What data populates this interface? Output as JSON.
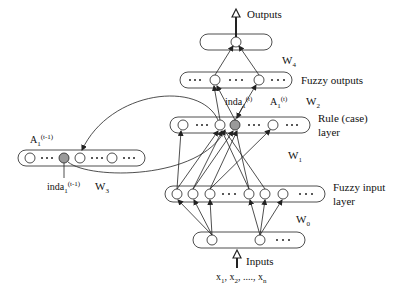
{
  "diagram": {
    "type": "neural-fuzzy network architecture",
    "colors": {
      "stroke": "#222222",
      "shaded_node": "#9a9a9a",
      "background": "#ffffff"
    },
    "layers": [
      {
        "id": "output",
        "label": "",
        "nodes": 1,
        "has_ellipsis": false
      },
      {
        "id": "fuzzy_outputs",
        "label": "Fuzzy outputs",
        "nodes": 2,
        "has_ellipsis": true
      },
      {
        "id": "rule",
        "label_line1": "Rule (case)",
        "label_line2": "layer",
        "nodes": 4,
        "shaded_node_index": 2,
        "has_ellipsis": true
      },
      {
        "id": "context",
        "label": "",
        "nodes": 4,
        "shaded_node_index": 1,
        "has_ellipsis": true
      },
      {
        "id": "fuzzy_input",
        "label_line1": "Fuzzy input",
        "label_line2": "layer",
        "nodes": 6,
        "has_ellipsis": true
      },
      {
        "id": "input",
        "label": "",
        "nodes": 2,
        "has_ellipsis": true
      }
    ],
    "labels": {
      "outputs": "Outputs",
      "inputs": "Inputs",
      "input_vars": {
        "x1": "x",
        "x1_sub": "1",
        "x2": "x",
        "x2_sub": "2",
        "dots": "....",
        "xn": "x",
        "xn_sub": "n"
      },
      "fuzzy_outputs": "Fuzzy outputs",
      "rule_line1": "Rule (case)",
      "rule_line2": "layer",
      "fuzzy_input_line1": "Fuzzy input",
      "fuzzy_input_line2": "layer",
      "w4": {
        "base": "W",
        "sub": "4"
      },
      "w2": {
        "base": "W",
        "sub": "2"
      },
      "w1": {
        "base": "W",
        "sub": "1"
      },
      "w3": {
        "base": "W",
        "sub": "3"
      },
      "w0": {
        "base": "W",
        "sub": "0"
      },
      "inda_t": {
        "base": "inda",
        "sub": "1",
        "sup": "(t)"
      },
      "a_t": {
        "base": "A",
        "sub": "1",
        "sup": "(t)"
      },
      "a_t_minus_1": {
        "base": "A",
        "sub": "1",
        "sup": "(t-1)"
      },
      "inda_t_minus_1": {
        "base": "inda",
        "sub": "1",
        "sup": "(t-1)"
      }
    }
  }
}
